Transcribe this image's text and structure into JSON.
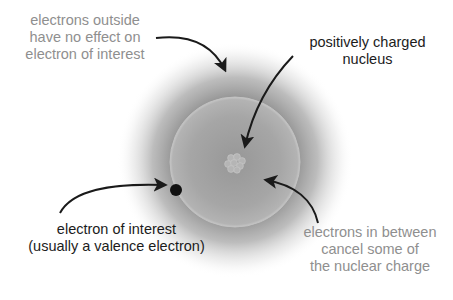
{
  "diagram": {
    "topic": "effective nuclear charge / electron shielding",
    "colors": {
      "background": "#ffffff",
      "outer_cloud": "#6f6f6f",
      "inner_sphere": "#a9a9a9",
      "inner_sphere_edge": "#c4c4c4",
      "nucleus": "#bdbdbd",
      "electron": "#111111",
      "arrow": "#1a1a1a",
      "gray_text": "#8f8f8f",
      "dark_text": "#1c1c1c"
    },
    "elements": {
      "outer_electron_cloud": {
        "cx": 235,
        "cy": 160,
        "r": 118
      },
      "inner_electron_shell": {
        "cx": 235,
        "cy": 162,
        "r": 65
      },
      "nucleus": {
        "cx": 235,
        "cy": 164,
        "r": 12
      },
      "electron_of_interest": {
        "cx": 176,
        "cy": 190,
        "r": 6
      }
    },
    "labels": {
      "outside": {
        "lines": [
          "electrons outside",
          "have no effect on",
          "electron of interest"
        ],
        "tone": "gray"
      },
      "nucleus": {
        "lines": [
          "positively charged",
          "nucleus"
        ],
        "tone": "dark"
      },
      "electron": {
        "lines": [
          "electron of interest",
          "(usually a valence electron)"
        ],
        "tone": "dark"
      },
      "between": {
        "lines": [
          "electrons in between",
          "cancel some of",
          "the nuclear charge"
        ],
        "tone": "gray"
      }
    }
  }
}
